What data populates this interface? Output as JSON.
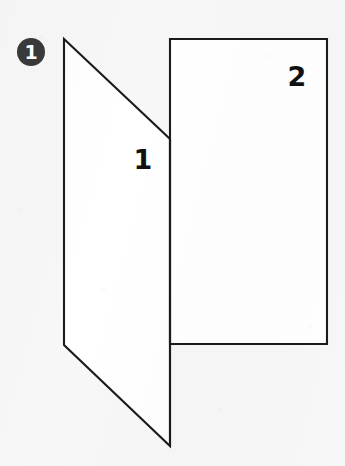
{
  "figure": {
    "badge": {
      "label": "1",
      "shape": "filled-circle",
      "fill_color": "#3a3a3a",
      "text_color": "#ffffff",
      "center": {
        "x": 31,
        "y": 52
      },
      "radius": 14
    },
    "panels": [
      {
        "name": "left-flap",
        "label": "1",
        "label_position": {
          "x": 143,
          "y": 161
        },
        "points": "64,39 170,139 170,446 64,345",
        "fill_color": "#ffffff",
        "stroke_color": "#1b1b1b"
      },
      {
        "name": "right-panel",
        "label": "2",
        "label_position": {
          "x": 297,
          "y": 78
        },
        "points": "170,39 327,39 327,344 170,344",
        "fill_color": "#ffffff",
        "stroke_color": "#1b1b1b"
      }
    ],
    "fold_line": {
      "name": "center-fold",
      "from": {
        "x": 170,
        "y": 139
      },
      "to": {
        "x": 170,
        "y": 446
      }
    },
    "background_color": "#f7f7f8",
    "stroke_width": 2.1
  }
}
